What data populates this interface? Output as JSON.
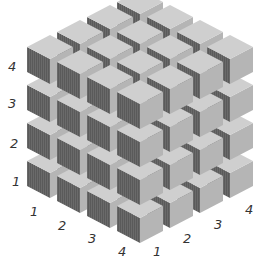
{
  "figure": {
    "grid_size": 4,
    "colors": {
      "top_face": "#cfcfcf",
      "right_face": "#b5b5b5",
      "left_face": "#666666",
      "left_face_stripe": "#585858",
      "label": "#333333"
    }
  },
  "labels": {
    "vertical_axis": [
      {
        "text": "4",
        "x": 8,
        "y": 60
      },
      {
        "text": "3",
        "x": 8,
        "y": 97
      },
      {
        "text": "2",
        "x": 10,
        "y": 137
      },
      {
        "text": "1",
        "x": 12,
        "y": 175
      }
    ],
    "left_axis": [
      {
        "text": "1",
        "x": 30,
        "y": 205
      },
      {
        "text": "2",
        "x": 58,
        "y": 219
      },
      {
        "text": "3",
        "x": 88,
        "y": 232
      },
      {
        "text": "4",
        "x": 118,
        "y": 245
      }
    ],
    "right_axis": [
      {
        "text": "1",
        "x": 153,
        "y": 245
      },
      {
        "text": "2",
        "x": 183,
        "y": 232
      },
      {
        "text": "3",
        "x": 214,
        "y": 218
      },
      {
        "text": "4",
        "x": 245,
        "y": 203
      }
    ]
  }
}
